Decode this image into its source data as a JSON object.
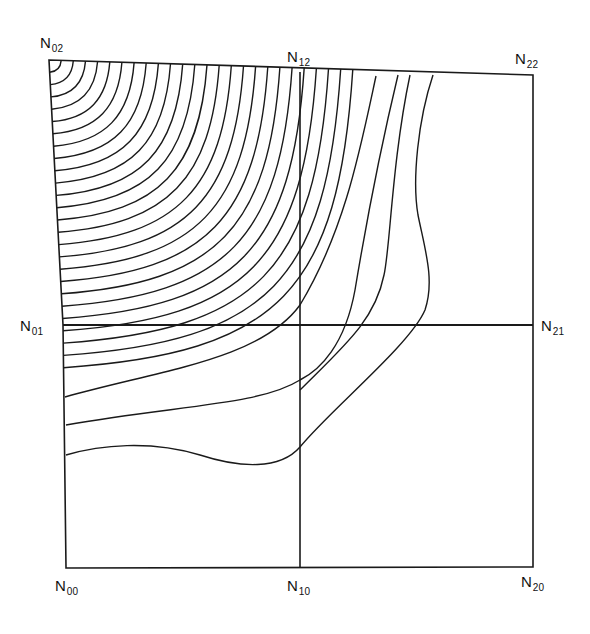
{
  "diagram": {
    "type": "contour-mesh",
    "line_color": "#1a1a1a",
    "background": "#ffffff",
    "nodes": [
      {
        "id": "N00",
        "base": "N",
        "sub": "00",
        "x": 66,
        "y": 568,
        "label_x": 55,
        "label_y": 578
      },
      {
        "id": "N10",
        "base": "N",
        "sub": "10",
        "x": 300,
        "y": 568,
        "label_x": 287,
        "label_y": 578
      },
      {
        "id": "N20",
        "base": "N",
        "sub": "20",
        "x": 533,
        "y": 567,
        "label_x": 521,
        "label_y": 574
      },
      {
        "id": "N01",
        "base": "N",
        "sub": "01",
        "x": 63,
        "y": 325,
        "label_x": 20,
        "label_y": 318
      },
      {
        "id": "N21",
        "base": "N",
        "sub": "21",
        "x": 533,
        "y": 325,
        "label_x": 541,
        "label_y": 318
      },
      {
        "id": "N02",
        "base": "N",
        "sub": "02",
        "x": 49,
        "y": 60,
        "label_x": 40,
        "label_y": 35
      },
      {
        "id": "N12",
        "base": "N",
        "sub": "12",
        "x": 300,
        "y": 72,
        "label_x": 287,
        "label_y": 49
      },
      {
        "id": "N22",
        "base": "N",
        "sub": "22",
        "x": 533,
        "y": 75,
        "label_x": 515,
        "label_y": 51
      }
    ],
    "contour_count": 34
  }
}
